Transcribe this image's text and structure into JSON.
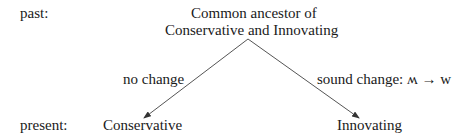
{
  "rows": {
    "past": "past:",
    "present": "present:"
  },
  "ancestor": {
    "line1": "Common ancestor of",
    "line2": "Conservative and Innovating"
  },
  "branches": {
    "left": {
      "label": "no change",
      "target": "Conservative"
    },
    "right": {
      "label": "sound change: ʍ → w",
      "target": "Innovating"
    }
  }
}
